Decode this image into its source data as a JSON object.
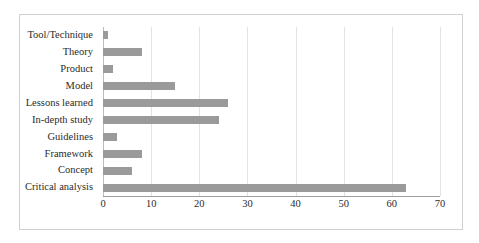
{
  "chart_data": {
    "type": "bar",
    "orientation": "horizontal",
    "title": "",
    "xlabel": "",
    "ylabel": "",
    "xlim": [
      0,
      70
    ],
    "xticks": [
      0,
      10,
      20,
      30,
      40,
      50,
      60,
      70
    ],
    "grid": true,
    "legend": false,
    "bar_color": "#9a9a9a",
    "gridline_color": "#e3e3e3",
    "categories": [
      "Tool/Technique",
      "Theory",
      "Product",
      "Model",
      "Lessons learned",
      "In-depth study",
      "Guidelines",
      "Framework",
      "Concept",
      "Critical analysis"
    ],
    "values": [
      1,
      8,
      2,
      15,
      26,
      24,
      3,
      8,
      6,
      63
    ]
  }
}
